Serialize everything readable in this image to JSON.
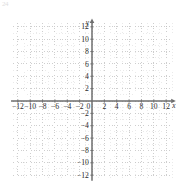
{
  "figure": {
    "corner_label": "24",
    "axis_labels": {
      "x": "x",
      "y": "y"
    }
  },
  "chart_data": {
    "type": "line",
    "title": "",
    "subtitle": "",
    "xlabel": "x",
    "ylabel": "y",
    "xlim": [
      -13,
      13
    ],
    "ylim": [
      -13,
      13
    ],
    "grid": true,
    "grid_step": 1,
    "grid_major_step": 2,
    "legend": "none",
    "xticks": [
      -12,
      -10,
      -8,
      -6,
      -4,
      -2,
      0,
      2,
      4,
      6,
      8,
      10,
      12
    ],
    "xticklabels": [
      "−12",
      "−10",
      "−8",
      "−6",
      "−4",
      "−2",
      "0",
      "2",
      "4",
      "6",
      "8",
      "10",
      "12"
    ],
    "yticks": [
      12,
      10,
      8,
      6,
      4,
      2,
      -2,
      -4,
      -6,
      -8,
      -10,
      -12
    ],
    "yticklabels": [
      "12",
      "10",
      "8",
      "6",
      "4",
      "2",
      "−2",
      "−4",
      "−6",
      "−8",
      "−10",
      "−12"
    ],
    "curve": {
      "name": "parabola",
      "equation": "y = x^2 + 5x - 6",
      "opens": "up",
      "vertex": [
        -2.5,
        -10.5
      ],
      "roots": [
        -6,
        1
      ],
      "y_intercept": -6,
      "color": "#3a3a3a",
      "arrow_start": [
        -8.3,
        12
      ],
      "arrow_end": [
        2.3,
        11.7
      ],
      "points": [
        [
          -8.3,
          12.0
        ],
        [
          -8.0,
          10.0
        ],
        [
          -7.5,
          12.25
        ],
        [
          -7.0,
          8.0
        ],
        [
          -6.5,
          3.75
        ],
        [
          -6.0,
          0.0
        ],
        [
          -5.5,
          -3.25
        ],
        [
          -5.0,
          -6.0
        ],
        [
          -4.5,
          -8.25
        ],
        [
          -4.0,
          -10.0
        ],
        [
          -3.5,
          -11.25
        ],
        [
          -3.0,
          -12.0
        ],
        [
          -2.5,
          -10.5
        ],
        [
          -2.0,
          -12.0
        ],
        [
          -1.5,
          -11.25
        ],
        [
          -1.0,
          -10.0
        ],
        [
          -0.5,
          -8.25
        ],
        [
          0.0,
          -6.0
        ],
        [
          0.5,
          -3.25
        ],
        [
          1.0,
          0.0
        ],
        [
          1.5,
          3.75
        ],
        [
          2.0,
          8.0
        ],
        [
          2.3,
          11.7
        ]
      ]
    },
    "colors": {
      "curve": "#3a3a3a",
      "axis": "#6e6e6e",
      "grid_minor": "#d8d8d8",
      "grid_major": "#bdbdbd",
      "tick_text": "#2b2b2b"
    }
  }
}
